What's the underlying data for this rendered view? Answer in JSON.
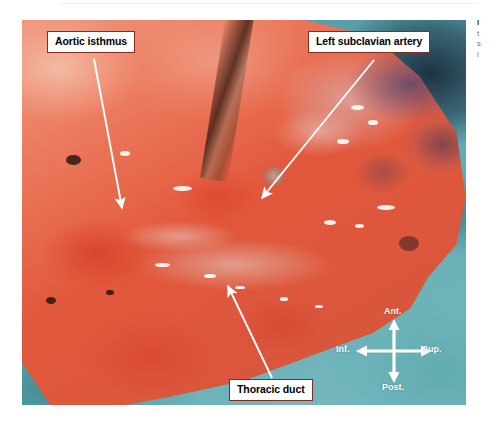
{
  "page": {
    "background_color": "#ffffff",
    "width": 495,
    "height": 426
  },
  "figure": {
    "type": "surgical-photograph",
    "drape_color": "#5fa7b0",
    "tissue_color": "#dd573d",
    "label_border_color": "#8a2b20",
    "arrow_color": "#ffffff",
    "labels": [
      {
        "id": "aortic-isthmus",
        "text": "Aortic isthmus"
      },
      {
        "id": "left-subclavian-artery",
        "text": "Left subclavian artery"
      },
      {
        "id": "thoracic-duct",
        "text": "Thoracic duct"
      }
    ]
  },
  "compass": {
    "name": "orientation-compass",
    "anterior": "Ant.",
    "posterior": "Post.",
    "inferior": "Inf.",
    "superior": "Sup.",
    "color": "#ffffff"
  },
  "caption": {
    "lines": [
      "I",
      "t",
      "s",
      "i"
    ]
  }
}
